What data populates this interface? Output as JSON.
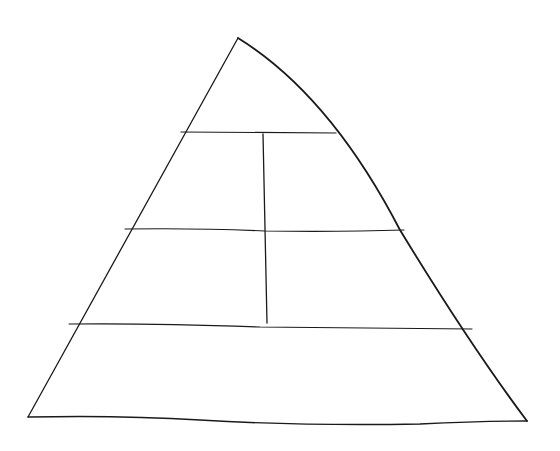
{
  "diagram": {
    "type": "pyramid",
    "style": "hand-drawn",
    "colors": {
      "background": "#ffffff",
      "line": "#1a1a1a"
    },
    "outline": {
      "apex": [
        238,
        38
      ],
      "bottom_left": [
        28,
        417
      ],
      "bottom_right": [
        527,
        421
      ]
    },
    "tiers": [
      {
        "name": "tier-1-top",
        "sections": 1,
        "label": ""
      },
      {
        "name": "tier-2",
        "sections": 2,
        "label": ""
      },
      {
        "name": "tier-3",
        "sections": 2,
        "label": ""
      },
      {
        "name": "tier-4-base",
        "sections": 1,
        "label": ""
      }
    ],
    "horizontal_lines": [
      {
        "x1": 181,
        "y1": 132,
        "x2": 336,
        "y2": 133
      },
      {
        "x1": 125,
        "y1": 229,
        "x2": 404,
        "y2": 230
      },
      {
        "x1": 69,
        "y1": 324,
        "x2": 472,
        "y2": 329
      }
    ],
    "vertical_divider": {
      "x1": 263,
      "y1": 134,
      "x2": 267,
      "y2": 323
    }
  }
}
